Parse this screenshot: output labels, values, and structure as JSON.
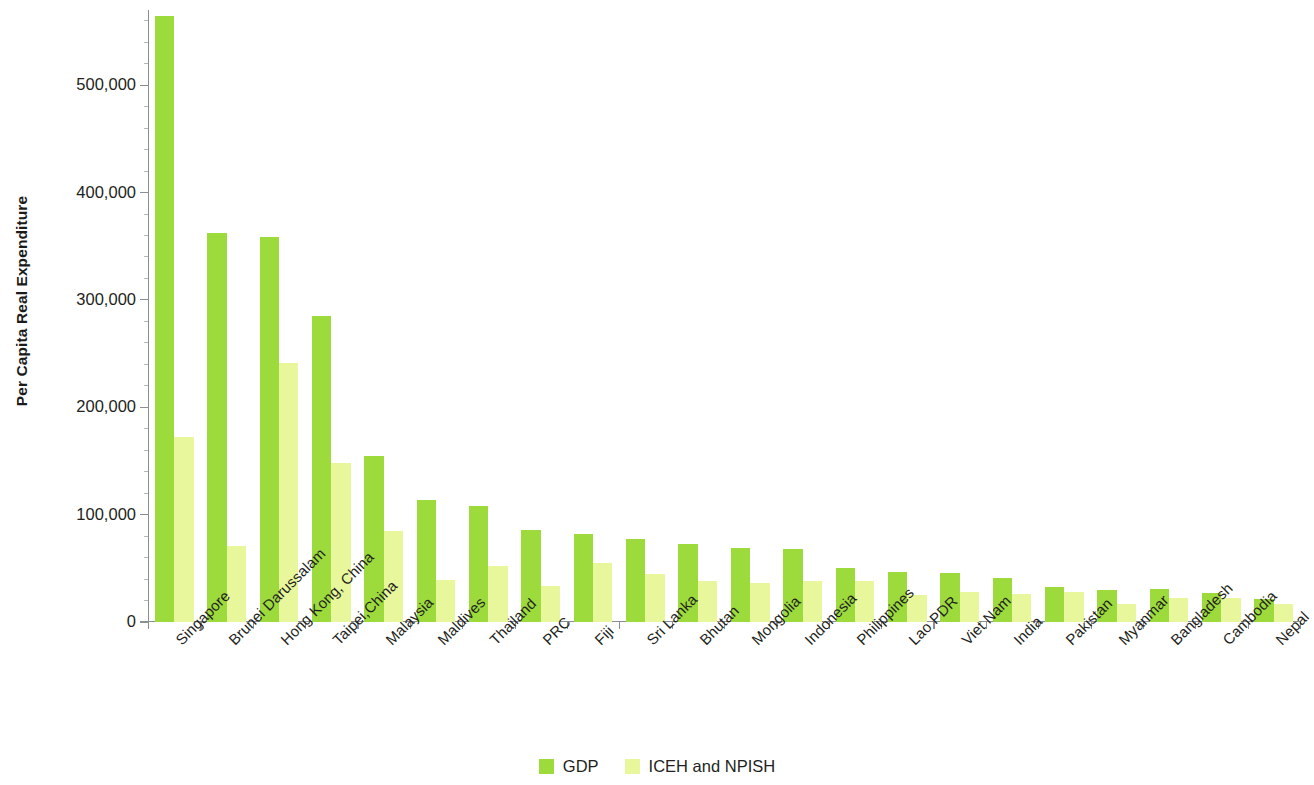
{
  "chart_data": {
    "type": "bar",
    "title": "",
    "xlabel": "",
    "ylabel": "Per Capita Real Expenditure",
    "ylim": [
      0,
      570000
    ],
    "ytick_labels": [
      "0",
      "100,000",
      "200,000",
      "300,000",
      "400,000",
      "500,000"
    ],
    "ytick_values": [
      0,
      100000,
      200000,
      300000,
      400000,
      500000
    ],
    "grid": false,
    "legend_position": "bottom-center",
    "categories": [
      "Singapore",
      "Brunei Darussalam",
      "Hong Kong, China",
      "Taipei,China",
      "Malaysia",
      "Maldives",
      "Thailand",
      "PRC",
      "Fiji",
      "Sri Lanka",
      "Bhutan",
      "Mongolia",
      "Indonesia",
      "Philippines",
      "Lao PDR",
      "Viet Nam",
      "India",
      "Pakistan",
      "Myanmar",
      "Bangladesh",
      "Cambodia",
      "Nepal"
    ],
    "series": [
      {
        "name": "GDP",
        "color": "#9ddb3d",
        "values": [
          564000,
          362000,
          359000,
          285000,
          155000,
          114000,
          108000,
          86000,
          82000,
          77000,
          73000,
          69000,
          68000,
          50000,
          47000,
          46000,
          41000,
          33000,
          30000,
          31000,
          27000,
          21000
        ]
      },
      {
        "name": "ICEH and NPISH",
        "color": "#e9f79c",
        "values": [
          172000,
          71000,
          241000,
          148000,
          85000,
          39000,
          52000,
          34000,
          55000,
          45000,
          38000,
          36000,
          38000,
          38000,
          25000,
          28000,
          26000,
          28000,
          17000,
          22000,
          22000,
          17000
        ]
      }
    ]
  },
  "legend": {
    "items": [
      {
        "label": "GDP",
        "color": "#9ddb3d"
      },
      {
        "label": "ICEH and NPISH",
        "color": "#e9f79c"
      }
    ]
  },
  "axis": {
    "y_title": "Per Capita Real Expenditure"
  }
}
